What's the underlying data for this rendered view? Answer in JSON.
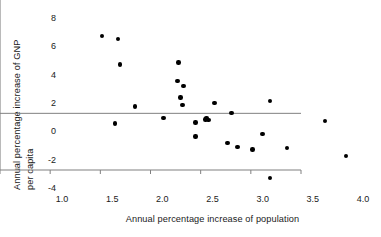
{
  "chart_data": {
    "type": "scatter",
    "title": "",
    "xlabel": "Annual percentage increase of population",
    "ylabel_line1": "Annual percentage increase of GNP",
    "ylabel_line2": "per capita",
    "xlim": [
      1.0,
      4.0
    ],
    "ylim": [
      -4,
      8
    ],
    "xticks": [
      1.0,
      1.5,
      2.0,
      2.5,
      3.0,
      3.5,
      4.0
    ],
    "xtick_labels": [
      "1.0",
      "1.5",
      "2.0",
      "2.5",
      "3.0",
      "3.5",
      "4.0"
    ],
    "yticks": [
      -4,
      -2,
      0,
      2,
      4,
      6,
      8
    ],
    "ytick_labels": [
      "-4",
      "-2",
      "0",
      "2",
      "4",
      "6",
      "8"
    ],
    "grid": false,
    "legend": false,
    "zero_line": 0,
    "marker": "filled-circle",
    "marker_color": "#000000",
    "axis_color": "#808080",
    "points": [
      {
        "x": 1.4,
        "y": 6.8
      },
      {
        "x": 1.56,
        "y": 6.6
      },
      {
        "x": 1.58,
        "y": 4.8
      },
      {
        "x": 1.53,
        "y": 0.62
      },
      {
        "x": 1.73,
        "y": 1.82
      },
      {
        "x": 2.01,
        "y": 1.0
      },
      {
        "x": 2.16,
        "y": 4.92
      },
      {
        "x": 2.15,
        "y": 3.62
      },
      {
        "x": 2.21,
        "y": 3.28
      },
      {
        "x": 2.18,
        "y": 2.45
      },
      {
        "x": 2.2,
        "y": 1.92
      },
      {
        "x": 2.33,
        "y": 0.7
      },
      {
        "x": 2.33,
        "y": -0.3
      },
      {
        "x": 2.44,
        "y": 1.02
      },
      {
        "x": 2.46,
        "y": 0.86
      },
      {
        "x": 2.43,
        "y": 0.9
      },
      {
        "x": 2.52,
        "y": 2.05
      },
      {
        "x": 2.65,
        "y": -0.75
      },
      {
        "x": 2.69,
        "y": 1.36
      },
      {
        "x": 2.75,
        "y": -1.05
      },
      {
        "x": 2.9,
        "y": -1.22
      },
      {
        "x": 3.0,
        "y": -0.1
      },
      {
        "x": 3.07,
        "y": 2.23
      },
      {
        "x": 3.07,
        "y": -3.22
      },
      {
        "x": 3.24,
        "y": -1.12
      },
      {
        "x": 3.62,
        "y": 0.78
      },
      {
        "x": 3.83,
        "y": -1.66
      }
    ]
  }
}
